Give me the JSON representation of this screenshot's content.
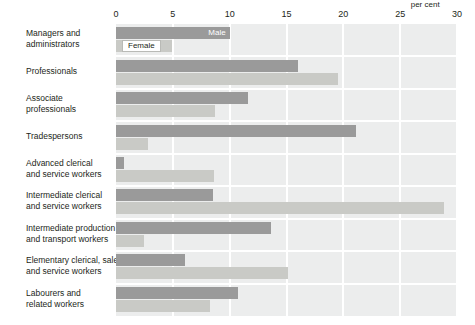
{
  "chart_data": {
    "type": "bar",
    "orientation": "horizontal",
    "title": "",
    "xlabel": "per cent",
    "ylabel": "",
    "xlim": [
      0,
      30
    ],
    "xticks": [
      0,
      5,
      10,
      15,
      20,
      25,
      30
    ],
    "xtick_labels": [
      "0",
      "5",
      "10",
      "15",
      "20",
      "25",
      "30"
    ],
    "grid": true,
    "grid_axis": "x",
    "legend_position": "in-plot-first-group",
    "categories": [
      "Managers and administrators",
      "Professionals",
      "Associate professionals",
      "Tradespersons",
      "Advanced clerical and service workers",
      "Intermediate clerical and service workers",
      "Intermediate production and transport workers",
      "Elementary clerical, sales and service workers",
      "Labourers and related workers"
    ],
    "category_lines": [
      [
        "Managers and",
        "administrators"
      ],
      [
        "Professionals"
      ],
      [
        "Associate",
        "professionals"
      ],
      [
        "Tradespersons"
      ],
      [
        "Advanced clerical",
        "and service workers"
      ],
      [
        "Intermediate clerical",
        "and service workers"
      ],
      [
        "Intermediate production",
        "and transport workers"
      ],
      [
        "Elementary clerical, sales",
        "and service workers"
      ],
      [
        "Labourers and",
        "related workers"
      ]
    ],
    "series": [
      {
        "name": "Male",
        "color": "#9a9a9a",
        "values": [
          10.0,
          16.0,
          11.6,
          21.1,
          0.7,
          8.5,
          13.6,
          6.1,
          10.7
        ]
      },
      {
        "name": "Female",
        "color": "#c9cac6",
        "values": [
          4.9,
          19.5,
          8.7,
          2.8,
          8.6,
          28.9,
          2.5,
          15.1,
          8.3
        ]
      }
    ]
  },
  "axis": {
    "unit_label": "per cent"
  },
  "legend": {
    "male_label": "Male",
    "female_label": "Female"
  },
  "colors": {
    "male_bar": "#9a9a9a",
    "female_bar": "#c9cac6",
    "panel_background": "#eceded",
    "gridline": "#ffffff",
    "text": "#231f20"
  }
}
